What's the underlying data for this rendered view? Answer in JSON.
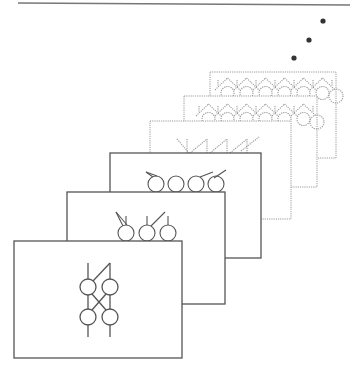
{
  "figure": {
    "width": 350,
    "height": 372,
    "background": "#ffffff",
    "stroke_color": "#555555",
    "dotted_color": "#9a9a9a",
    "top_rule": {
      "x1": 18,
      "y1": 3,
      "x2": 350,
      "y2": 5,
      "color": "#777777"
    },
    "ellipsis_dots": [
      {
        "cx": 323,
        "cy": 21,
        "r": 2.6
      },
      {
        "cx": 309,
        "cy": 40,
        "r": 2.6
      },
      {
        "cx": 294,
        "cy": 58,
        "r": 2.6
      }
    ],
    "frames": [
      {
        "id": 6,
        "x": 210,
        "y": 72,
        "w": 126,
        "h": 86,
        "style": "dotted",
        "symbol": "lattice-row",
        "cells": 6,
        "sym_y": 78,
        "sym_x": 218,
        "cell_w": 19
      },
      {
        "id": 5,
        "x": 184,
        "y": 96,
        "w": 133,
        "h": 91,
        "style": "dotted",
        "symbol": "lattice-row",
        "cells": 6,
        "sym_y": 104,
        "sym_x": 199,
        "cell_w": 19
      },
      {
        "id": 4,
        "x": 150,
        "y": 121,
        "w": 141,
        "h": 98,
        "style": "dotted",
        "symbol": "fan-row",
        "cells": 4,
        "sym_y": 139,
        "sym_x": 187,
        "cell_w": 20
      },
      {
        "id": 3,
        "x": 110,
        "y": 153,
        "w": 151,
        "h": 105,
        "style": "solid",
        "symbol": "circle-fan",
        "cells": 4,
        "sym_y": 172,
        "sym_x": 156,
        "cell_w": 20
      },
      {
        "id": 2,
        "x": 67,
        "y": 192,
        "w": 158,
        "h": 112,
        "style": "solid",
        "symbol": "circle-fan",
        "cells": 3,
        "sym_y": 212,
        "sym_x": 126,
        "cell_w": 21
      },
      {
        "id": 1,
        "x": 14,
        "y": 241,
        "w": 168,
        "h": 117,
        "style": "solid",
        "symbol": "crossed-pair"
      }
    ],
    "crossed_pair": {
      "left_x": 88,
      "right_x": 110,
      "top_y": 263,
      "bottom_y": 337,
      "circle_top_y": 287,
      "circle_bottom_y": 317,
      "r": 8
    },
    "caption": ""
  }
}
